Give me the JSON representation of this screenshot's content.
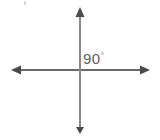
{
  "figure": {
    "background_color": "#ffffff",
    "canvas": {
      "width": 160,
      "height": 140
    },
    "label": {
      "value": "90",
      "degree_symbol": "°",
      "full_text": "90°",
      "color": "#5f5f5f",
      "quadrant": "upper-right"
    },
    "intersection": {
      "x": 80,
      "y": 70
    },
    "lines": [
      {
        "name": "horizontal-axis",
        "orientation": "horizontal",
        "color": "#6a6a6a",
        "stroke_width": 2,
        "from": {
          "x": 12,
          "y": 70
        },
        "to": {
          "x": 150,
          "y": 70
        },
        "arrowheads": [
          "left",
          "right"
        ]
      },
      {
        "name": "vertical-axis",
        "orientation": "vertical",
        "color": "#8a8a8a",
        "stroke_width": 2,
        "from": {
          "x": 80,
          "y": 8
        },
        "to": {
          "x": 80,
          "y": 133
        },
        "arrowheads": [
          "up",
          "down"
        ]
      }
    ],
    "artifact": {
      "name": "scan-speck",
      "color": "#d8d8d8",
      "x": 24,
      "y": 1
    }
  }
}
